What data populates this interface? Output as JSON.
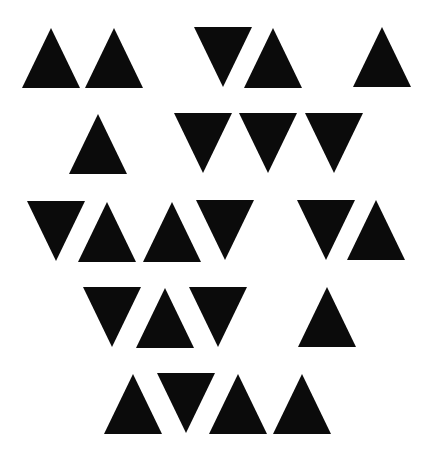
{
  "canvas": {
    "width": 433,
    "height": 458,
    "background": "#ffffff"
  },
  "fill_color": "#0b0b0b",
  "triangle_size": {
    "width": 58,
    "height": 60
  },
  "rows": [
    {
      "name": "row-1",
      "triangles": [
        {
          "dir": "up",
          "x": 22,
          "y": 28
        },
        {
          "dir": "up",
          "x": 85,
          "y": 28
        },
        {
          "dir": "down",
          "x": 194,
          "y": 27
        },
        {
          "dir": "up",
          "x": 244,
          "y": 28
        },
        {
          "dir": "up",
          "x": 353,
          "y": 27
        }
      ]
    },
    {
      "name": "row-2",
      "triangles": [
        {
          "dir": "up",
          "x": 69,
          "y": 114
        },
        {
          "dir": "down",
          "x": 174,
          "y": 113
        },
        {
          "dir": "down",
          "x": 239,
          "y": 113
        },
        {
          "dir": "down",
          "x": 305,
          "y": 113
        }
      ]
    },
    {
      "name": "row-3",
      "triangles": [
        {
          "dir": "down",
          "x": 27,
          "y": 201
        },
        {
          "dir": "up",
          "x": 78,
          "y": 202
        },
        {
          "dir": "up",
          "x": 143,
          "y": 202
        },
        {
          "dir": "down",
          "x": 196,
          "y": 200
        },
        {
          "dir": "down",
          "x": 297,
          "y": 200
        },
        {
          "dir": "up",
          "x": 347,
          "y": 200
        }
      ]
    },
    {
      "name": "row-4",
      "triangles": [
        {
          "dir": "down",
          "x": 83,
          "y": 287
        },
        {
          "dir": "up",
          "x": 136,
          "y": 288
        },
        {
          "dir": "down",
          "x": 189,
          "y": 287
        },
        {
          "dir": "up",
          "x": 298,
          "y": 287
        }
      ]
    },
    {
      "name": "row-5",
      "triangles": [
        {
          "dir": "up",
          "x": 104,
          "y": 374
        },
        {
          "dir": "down",
          "x": 157,
          "y": 373
        },
        {
          "dir": "up",
          "x": 209,
          "y": 374
        },
        {
          "dir": "up",
          "x": 273,
          "y": 374
        }
      ]
    }
  ]
}
